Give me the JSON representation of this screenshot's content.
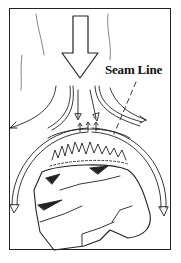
{
  "diagram": {
    "labels": {
      "seam_line": "Seam Line"
    },
    "colors": {
      "ink": "#222222",
      "background": "#ffffff"
    },
    "elements": [
      "downward-flow-arrow",
      "diverging-flow-arrows",
      "stone-outline",
      "seam-line-pointer",
      "outer-arc-arrows",
      "grain-texture"
    ]
  }
}
